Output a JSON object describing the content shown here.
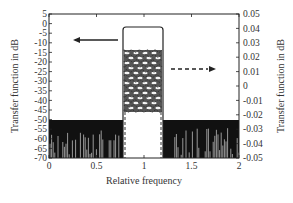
{
  "chart_data": {
    "type": "line",
    "title": "",
    "xlabel": "Relative frequency",
    "ylabel_left": "Transfer function in dB",
    "ylabel_right": "Transfer function in dB",
    "xlim": [
      0,
      2
    ],
    "ylim_left": [
      -70,
      5
    ],
    "ylim_right": [
      -0.05,
      0.05
    ],
    "x_ticks": [
      "0",
      "0.5",
      "1",
      "1.5",
      "2"
    ],
    "y_ticks_left": [
      "5",
      "0",
      "-5",
      "-10",
      "-15",
      "-20",
      "-25",
      "-30",
      "-35",
      "-40",
      "-45",
      "-50",
      "-55",
      "-60",
      "-65",
      "-70"
    ],
    "y_ticks_right": [
      "0.05",
      "0.04",
      "0.03",
      "0.02",
      "0.01",
      "0",
      "-0.01",
      "-0.02",
      "-0.03",
      "-0.04",
      "-0.05"
    ],
    "grid": false,
    "legend": null,
    "series": [
      {
        "name": "Full response (left axis, solid)",
        "axis": "left",
        "style": "solid",
        "description": "Flat passband near 0 dB between relative frequency ~0.8 and ~1.2; stopband noise floor at about -50 dB and below, down to -70 dB",
        "passband": {
          "x_start": 0.8,
          "x_end": 1.2,
          "level_db": 0
        },
        "stopband_level_db": -50
      },
      {
        "name": "Passband ripple (right axis, dashed)",
        "axis": "right",
        "style": "dashed",
        "description": "Dense ripple oscillating between about -0.03 and 0.02 within passband 0.8-1.2",
        "x_range": [
          0.8,
          1.2
        ],
        "ripple_range": [
          -0.03,
          0.02
        ]
      }
    ],
    "annotations": [
      {
        "type": "arrow",
        "direction": "left",
        "style": "solid",
        "meaning": "solid curve refers to left axis"
      },
      {
        "type": "arrow",
        "direction": "right",
        "style": "dashed",
        "meaning": "dashed curve refers to right axis"
      }
    ]
  }
}
